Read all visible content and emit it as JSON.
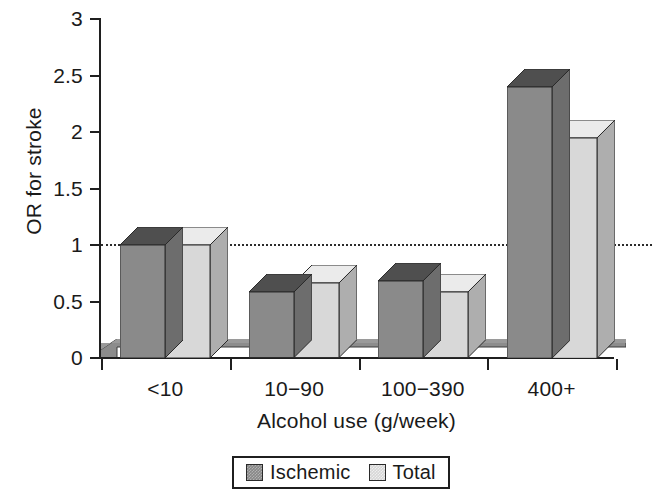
{
  "chart_data": {
    "type": "bar",
    "title": "",
    "subtitle": "",
    "xlabel": "Alcohol use (g/week)",
    "ylabel": "OR for stroke",
    "categories": [
      "<10",
      "10−90",
      "100−390",
      "400+"
    ],
    "series": [
      {
        "name": "Ischemic",
        "color": "#878787",
        "values": [
          1.0,
          0.58,
          0.68,
          2.4
        ]
      },
      {
        "name": "Total",
        "color": "#d6d6d6",
        "values": [
          1.0,
          0.66,
          0.58,
          1.95
        ]
      }
    ],
    "ylim": [
      0,
      3
    ],
    "ytick_values": [
      0,
      0.5,
      1,
      1.5,
      2,
      2.5,
      3
    ],
    "ytick_labels": [
      "0",
      "0.5",
      "1",
      "1.5",
      "2",
      "2.5",
      "3"
    ],
    "grid": false,
    "legend_position": "bottom",
    "annotations": [
      {
        "type": "reference-line",
        "axis": "y",
        "value": 1,
        "style": "dotted",
        "label": ""
      }
    ],
    "style": "3d-bars-grayscale"
  },
  "legend": {
    "entries": [
      {
        "label": "Ischemic",
        "color": "#878787"
      },
      {
        "label": "Total",
        "color": "#d6d6d6"
      }
    ]
  },
  "axes": {
    "y_title": "OR for stroke",
    "x_title": "Alcohol use (g/week)"
  }
}
